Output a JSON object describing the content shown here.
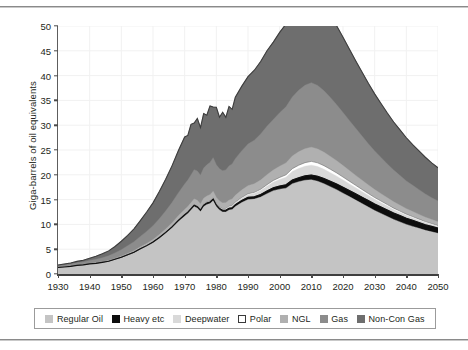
{
  "chart_data": {
    "type": "area",
    "stacked": true,
    "title": "",
    "subtitle": "",
    "xlabel": "",
    "ylabel": "Giga-barrels of oil equivalents",
    "xlim": [
      1930,
      2050
    ],
    "ylim": [
      0,
      50
    ],
    "yticks": [
      0,
      5,
      10,
      15,
      20,
      25,
      30,
      35,
      40,
      45,
      50
    ],
    "ytick_labels": [
      "0",
      "5",
      "10",
      "15",
      "20",
      "25",
      "30",
      "35",
      "40",
      "45",
      "50"
    ],
    "xticks": [
      1930,
      1940,
      1950,
      1960,
      1970,
      1980,
      1990,
      2000,
      2010,
      2020,
      2030,
      2040,
      2050
    ],
    "xtick_labels": [
      "1930",
      "1940",
      "1950",
      "1960",
      "1970",
      "1980",
      "1990",
      "2000",
      "2010",
      "2020",
      "2030",
      "2040",
      "2050"
    ],
    "grid": true,
    "grid_color": "#f1f1f1",
    "legend_position": "bottom",
    "x": [
      1930,
      1932,
      1934,
      1936,
      1938,
      1940,
      1942,
      1944,
      1946,
      1948,
      1950,
      1952,
      1954,
      1956,
      1958,
      1960,
      1962,
      1964,
      1966,
      1968,
      1970,
      1971,
      1972,
      1973,
      1974,
      1975,
      1976,
      1977,
      1978,
      1979,
      1980,
      1981,
      1982,
      1983,
      1984,
      1985,
      1986,
      1988,
      1990,
      1992,
      1994,
      1996,
      1998,
      2000,
      2002,
      2004,
      2006,
      2008,
      2010,
      2012,
      2014,
      2016,
      2018,
      2020,
      2022,
      2024,
      2026,
      2028,
      2030,
      2032,
      2034,
      2036,
      2038,
      2040,
      2042,
      2044,
      2046,
      2048,
      2050
    ],
    "series": [
      {
        "name": "Regular Oil",
        "color": "#c4c4c4",
        "values": [
          1.3,
          1.4,
          1.5,
          1.7,
          1.8,
          2.0,
          2.1,
          2.3,
          2.5,
          2.9,
          3.3,
          3.8,
          4.3,
          5.0,
          5.6,
          6.3,
          7.2,
          8.2,
          9.3,
          10.6,
          11.7,
          12.2,
          12.9,
          13.6,
          13.3,
          12.6,
          13.6,
          14.0,
          14.2,
          14.8,
          13.6,
          12.9,
          12.5,
          12.5,
          12.9,
          13.0,
          13.6,
          14.4,
          15.0,
          15.1,
          15.5,
          16.2,
          16.8,
          17.1,
          17.3,
          18.2,
          18.6,
          18.9,
          19.0,
          18.7,
          18.2,
          17.6,
          17.0,
          16.3,
          15.6,
          14.9,
          14.2,
          13.5,
          12.8,
          12.2,
          11.6,
          11.0,
          10.5,
          10.0,
          9.6,
          9.2,
          8.8,
          8.5,
          8.2
        ]
      },
      {
        "name": "Heavy etc",
        "color": "#0d0d0d",
        "values": [
          0.02,
          0.02,
          0.03,
          0.03,
          0.04,
          0.04,
          0.05,
          0.05,
          0.06,
          0.07,
          0.08,
          0.09,
          0.1,
          0.11,
          0.12,
          0.14,
          0.16,
          0.18,
          0.2,
          0.22,
          0.25,
          0.26,
          0.27,
          0.28,
          0.28,
          0.28,
          0.3,
          0.31,
          0.32,
          0.33,
          0.33,
          0.33,
          0.34,
          0.35,
          0.36,
          0.37,
          0.39,
          0.42,
          0.45,
          0.48,
          0.52,
          0.56,
          0.6,
          0.65,
          0.7,
          0.76,
          0.82,
          0.88,
          0.95,
          1.0,
          1.05,
          1.1,
          1.15,
          1.2,
          1.25,
          1.28,
          1.3,
          1.32,
          1.33,
          1.33,
          1.32,
          1.3,
          1.28,
          1.25,
          1.22,
          1.18,
          1.14,
          1.1,
          1.05
        ]
      },
      {
        "name": "Deepwater",
        "color": "#d9d9d9",
        "values": [
          0,
          0,
          0,
          0,
          0,
          0,
          0,
          0,
          0,
          0,
          0,
          0,
          0,
          0,
          0,
          0,
          0,
          0,
          0.02,
          0.03,
          0.05,
          0.06,
          0.07,
          0.08,
          0.09,
          0.1,
          0.12,
          0.13,
          0.15,
          0.17,
          0.18,
          0.2,
          0.22,
          0.25,
          0.28,
          0.32,
          0.37,
          0.45,
          0.55,
          0.66,
          0.8,
          0.95,
          1.1,
          1.3,
          1.5,
          1.7,
          1.85,
          1.95,
          2.0,
          1.95,
          1.85,
          1.72,
          1.58,
          1.45,
          1.32,
          1.2,
          1.1,
          1.0,
          0.92,
          0.84,
          0.77,
          0.7,
          0.64,
          0.58,
          0.53,
          0.48,
          0.44,
          0.4,
          0.36
        ]
      },
      {
        "name": "Polar",
        "color": "#ffffff",
        "values": [
          0,
          0,
          0,
          0,
          0,
          0,
          0,
          0,
          0,
          0,
          0,
          0,
          0,
          0,
          0,
          0,
          0,
          0,
          0,
          0,
          0.02,
          0.02,
          0.03,
          0.03,
          0.04,
          0.04,
          0.05,
          0.05,
          0.06,
          0.06,
          0.07,
          0.07,
          0.08,
          0.09,
          0.1,
          0.11,
          0.12,
          0.15,
          0.18,
          0.22,
          0.26,
          0.3,
          0.36,
          0.42,
          0.5,
          0.58,
          0.66,
          0.72,
          0.76,
          0.76,
          0.74,
          0.7,
          0.65,
          0.6,
          0.55,
          0.5,
          0.45,
          0.41,
          0.37,
          0.34,
          0.31,
          0.28,
          0.26,
          0.24,
          0.22,
          0.2,
          0.18,
          0.17,
          0.15
        ]
      },
      {
        "name": "NGL",
        "color": "#b0b0b0",
        "values": [
          0.05,
          0.06,
          0.07,
          0.08,
          0.09,
          0.1,
          0.12,
          0.13,
          0.15,
          0.18,
          0.22,
          0.26,
          0.3,
          0.36,
          0.42,
          0.5,
          0.58,
          0.68,
          0.78,
          0.9,
          1.0,
          1.05,
          1.1,
          1.15,
          1.14,
          1.1,
          1.18,
          1.22,
          1.26,
          1.3,
          1.24,
          1.2,
          1.18,
          1.2,
          1.25,
          1.3,
          1.38,
          1.5,
          1.62,
          1.72,
          1.85,
          2.0,
          2.1,
          2.25,
          2.4,
          2.55,
          2.7,
          2.8,
          2.85,
          2.8,
          2.7,
          2.58,
          2.45,
          2.3,
          2.15,
          2.0,
          1.86,
          1.72,
          1.6,
          1.48,
          1.37,
          1.27,
          1.18,
          1.1,
          1.02,
          0.95,
          0.88,
          0.82,
          0.76
        ]
      },
      {
        "name": "Gas",
        "color": "#8c8c8c",
        "values": [
          0.3,
          0.35,
          0.4,
          0.45,
          0.5,
          0.6,
          0.7,
          0.8,
          0.95,
          1.1,
          1.3,
          1.55,
          1.8,
          2.1,
          2.45,
          2.8,
          3.2,
          3.65,
          4.1,
          4.6,
          5.1,
          5.35,
          5.6,
          5.9,
          5.9,
          5.8,
          6.1,
          6.3,
          6.5,
          6.8,
          6.6,
          6.5,
          6.5,
          6.6,
          6.9,
          7.1,
          7.4,
          7.9,
          8.4,
          8.8,
          9.3,
          9.8,
          10.2,
          10.8,
          11.3,
          11.9,
          12.4,
          12.8,
          13.0,
          12.8,
          12.4,
          11.9,
          11.3,
          10.7,
          10.1,
          9.5,
          8.9,
          8.3,
          7.8,
          7.3,
          6.8,
          6.4,
          6.0,
          5.6,
          5.3,
          5.0,
          4.7,
          4.4,
          4.2
        ]
      },
      {
        "name": "Non-Con Gas",
        "color": "#6e6e6e",
        "values": [
          0.15,
          0.18,
          0.22,
          0.28,
          0.35,
          0.45,
          0.6,
          0.8,
          1.0,
          1.3,
          1.7,
          2.1,
          2.6,
          3.2,
          3.9,
          4.6,
          5.5,
          6.4,
          7.4,
          8.5,
          9.5,
          9.0,
          10.2,
          9.4,
          10.6,
          9.6,
          11.0,
          10.0,
          11.4,
          10.2,
          11.6,
          10.4,
          11.8,
          10.6,
          12.0,
          11.0,
          12.4,
          13.0,
          13.6,
          14.1,
          14.6,
          15.2,
          15.6,
          16.2,
          16.7,
          17.2,
          17.6,
          17.9,
          18.0,
          17.7,
          17.2,
          16.6,
          15.9,
          15.2,
          14.4,
          13.6,
          12.9,
          12.2,
          11.5,
          10.9,
          10.3,
          9.7,
          9.2,
          8.7,
          8.2,
          7.8,
          7.4,
          7.0,
          6.7
        ]
      }
    ]
  },
  "legend": {
    "items": [
      {
        "label": "Regular Oil",
        "color": "#c4c4c4",
        "border": "#c4c4c4"
      },
      {
        "label": "Heavy etc",
        "color": "#0d0d0d",
        "border": "#0d0d0d"
      },
      {
        "label": "Deepwater",
        "color": "#d9d9d9",
        "border": "#d9d9d9"
      },
      {
        "label": "Polar",
        "color": "#ffffff",
        "border": "#3a3a3a"
      },
      {
        "label": "NGL",
        "color": "#b0b0b0",
        "border": "#b0b0b0"
      },
      {
        "label": "Gas",
        "color": "#8c8c8c",
        "border": "#8c8c8c"
      },
      {
        "label": "Non-Con Gas",
        "color": "#6e6e6e",
        "border": "#6e6e6e"
      }
    ]
  }
}
